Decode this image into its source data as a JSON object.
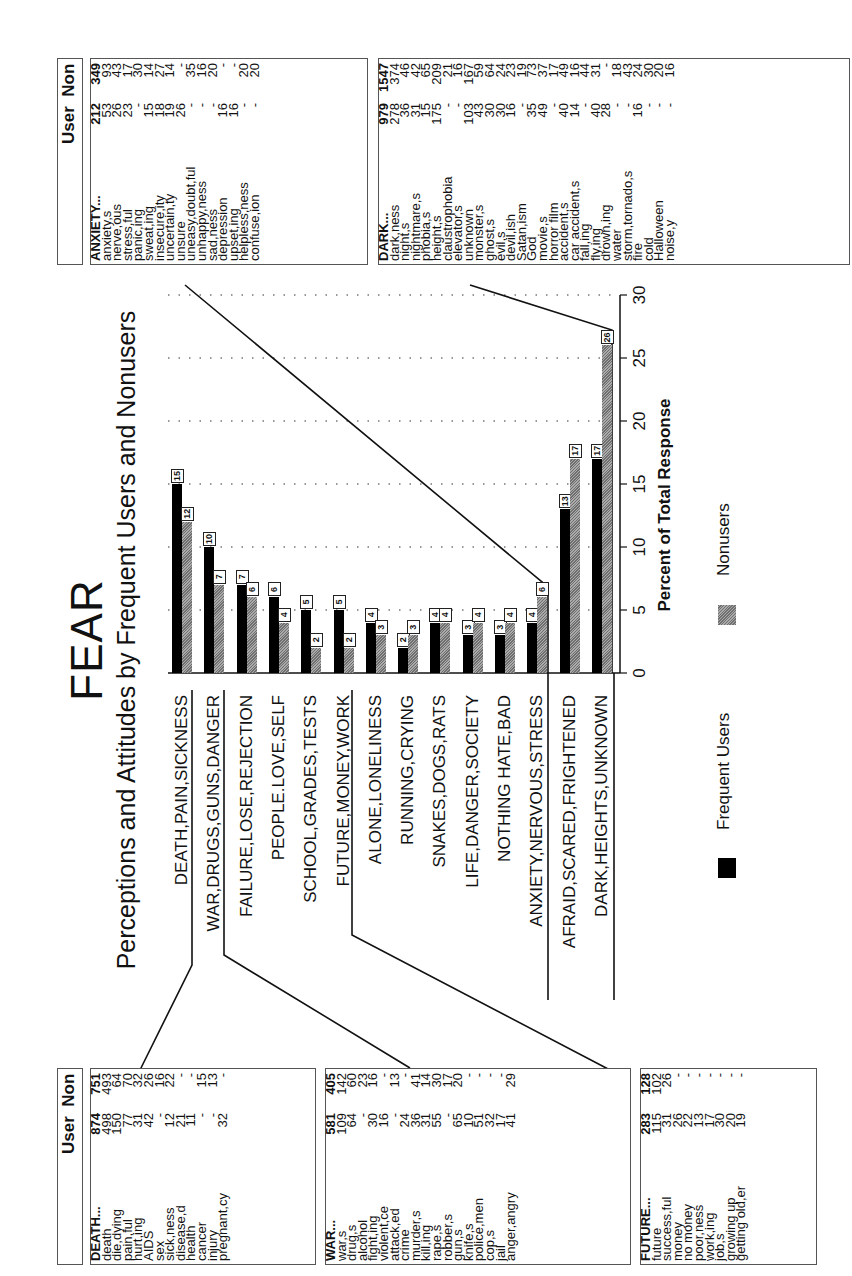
{
  "title": "FEAR",
  "subtitle": "Perceptions and Attitudes by Frequent Users and Nonusers",
  "axis": {
    "title": "Percent of Total Response",
    "ticks": [
      "0",
      "5",
      "10",
      "15",
      "20",
      "25",
      "30"
    ]
  },
  "legend": {
    "users_label": "Frequent Users",
    "non_label": "Nonusers"
  },
  "chart_data": {
    "type": "bar",
    "title": "FEAR",
    "subtitle": "Perceptions and Attitudes by Frequent Users and Nonusers",
    "xlabel": "",
    "ylabel": "Percent of Total Response",
    "ylim": [
      0,
      30
    ],
    "grid": true,
    "legend_position": "bottom",
    "categories": [
      "DEATH,PAIN,SICKNESS",
      "WAR,DRUGS,GUNS,DANGER",
      "FAILURE,LOSE,REJECTION",
      "PEOPLE.LOVE,SELF",
      "SCHOOL,GRADES,TESTS",
      "FUTURE,MONEY,WORK",
      "ALONE,LONELINESS",
      "RUNNING,CRYING",
      "SNAKES,DOGS,RATS",
      "LIFE,DANGER,SOCIETY",
      "NOTHING HATE,BAD",
      "ANXIETY,NERVOUS,STRESS",
      "AFRAID,SCARED,FRIGHTENED",
      "DARK,HEIGHTS,UNKNOWN"
    ],
    "series": [
      {
        "name": "Frequent Users",
        "color": "#000000",
        "values": [
          15,
          10,
          7,
          6,
          5,
          5,
          4,
          2,
          4,
          3,
          3,
          4,
          13,
          17
        ]
      },
      {
        "name": "Nonusers",
        "color": "#a8a8a8",
        "values": [
          12,
          7,
          6,
          4,
          2,
          2,
          3,
          3,
          4,
          4,
          4,
          6,
          17,
          26
        ]
      }
    ]
  },
  "table_header": {
    "user": "User",
    "non": "Non"
  },
  "tables": {
    "death": {
      "rows": [
        [
          "DEATH...",
          "874",
          "751"
        ],
        [
          "death",
          "498",
          "493"
        ],
        [
          "die,dying",
          "150",
          "64"
        ],
        [
          "pain,ful",
          "77",
          "70"
        ],
        [
          "hurt,ing",
          "31",
          "32"
        ],
        [
          "AIDS",
          "42",
          "26"
        ],
        [
          "sex",
          "-",
          "16"
        ],
        [
          "sick,ness",
          "12",
          "22"
        ],
        [
          "disease,d",
          "21",
          "-"
        ],
        [
          "health",
          "11",
          "-"
        ],
        [
          "cancer",
          "-",
          "15"
        ],
        [
          "injury",
          "-",
          "13"
        ],
        [
          "pregnant,cy",
          "32",
          "-"
        ]
      ]
    },
    "war": {
      "rows": [
        [
          "WAR...",
          "581",
          "405"
        ],
        [
          "war,s",
          "109",
          "142"
        ],
        [
          "drug,s",
          "64",
          "60"
        ],
        [
          "alcohol",
          "-",
          "23"
        ],
        [
          "fight,ing",
          "30",
          "16"
        ],
        [
          "violent,ce",
          "16",
          "-"
        ],
        [
          "attack,ed",
          "-",
          "13"
        ],
        [
          "crime",
          "24",
          "-"
        ],
        [
          "murder,s",
          "36",
          "41"
        ],
        [
          "kill,ing",
          "31",
          "14"
        ],
        [
          "rape,s",
          "55",
          "30"
        ],
        [
          "robber,s",
          "-",
          "17"
        ],
        [
          "gun,s",
          "65",
          "20"
        ],
        [
          "knife,s",
          "10",
          "-"
        ],
        [
          "police,men",
          "51",
          "-"
        ],
        [
          "cop,s",
          "32",
          "-"
        ],
        [
          "jail",
          "17",
          "-"
        ],
        [
          "anger,angry",
          "41",
          "29"
        ]
      ]
    },
    "future": {
      "rows": [
        [
          "FUTURE...",
          "283",
          "128"
        ],
        [
          "future",
          "115",
          "102"
        ],
        [
          "success,ful",
          "31",
          "26"
        ],
        [
          "money",
          "26",
          "-"
        ],
        [
          "no money",
          "22",
          "-"
        ],
        [
          "poor,ness",
          "13",
          "-"
        ],
        [
          "work,ing",
          "17",
          "-"
        ],
        [
          "job,s",
          "30",
          "-"
        ],
        [
          "growing up",
          "20",
          "-"
        ],
        [
          "getting old,er",
          "19",
          "-"
        ]
      ]
    },
    "anxiety": {
      "rows": [
        [
          "ANXIETY...",
          "212",
          "349"
        ],
        [
          "anxiety,s",
          "53",
          "93"
        ],
        [
          "nerve,ous",
          "26",
          "43"
        ],
        [
          "stress,ful",
          "23",
          "17"
        ],
        [
          "panic,ing",
          "-",
          "30"
        ],
        [
          "sweat,ing",
          "15",
          "14"
        ],
        [
          "insecure,ity",
          "18",
          "27"
        ],
        [
          "uncertain,ty",
          "19",
          "14"
        ],
        [
          "unsure",
          "26",
          "-"
        ],
        [
          "uneasy,doubt,ful",
          "-",
          "35"
        ],
        [
          "unhappy,ness",
          "-",
          "16"
        ],
        [
          "sad,ness",
          "-",
          "20"
        ],
        [
          "depression",
          "16",
          "-"
        ],
        [
          "upset,ing",
          "16",
          "-"
        ],
        [
          "helpless,ness",
          "-",
          "20"
        ],
        [
          "confuse,ion",
          "-",
          "20"
        ]
      ]
    },
    "dark": {
      "rows": [
        [
          "DARK...",
          "979",
          "1547"
        ],
        [
          "dark,ness",
          "278",
          "374"
        ],
        [
          "night,s",
          "36",
          "46"
        ],
        [
          "nightmare,s",
          "31",
          "42"
        ],
        [
          "phobia,s",
          "15",
          "65"
        ],
        [
          "height,s",
          "175",
          "209"
        ],
        [
          "claustrophobia",
          "-",
          "21"
        ],
        [
          "elevator,s",
          "-",
          "16"
        ],
        [
          "unknown",
          "103",
          "167"
        ],
        [
          "monster,s",
          "43",
          "59"
        ],
        [
          "ghost,s",
          "30",
          "64"
        ],
        [
          "evil,s",
          "30",
          "24"
        ],
        [
          "devil,ish",
          "16",
          "23"
        ],
        [
          "Satan,ism",
          "-",
          "19"
        ],
        [
          "God",
          "35",
          "73"
        ],
        [
          "movie,s",
          "49",
          "37"
        ],
        [
          "horror film",
          "-",
          "17"
        ],
        [
          "accident,s",
          "40",
          "49"
        ],
        [
          "car accident,s",
          "14",
          "16"
        ],
        [
          "fall,ing",
          "-",
          "44"
        ],
        [
          "fly,ing",
          "40",
          "31"
        ],
        [
          "drown,ing",
          "28",
          "-"
        ],
        [
          "water",
          "-",
          "18"
        ],
        [
          "storm,tornado,s",
          "-",
          "43"
        ],
        [
          "fire",
          "16",
          "24"
        ],
        [
          "cold",
          "-",
          "30"
        ],
        [
          "Halloween",
          "-",
          "20"
        ],
        [
          "noise,y",
          "-",
          "16"
        ]
      ]
    }
  }
}
